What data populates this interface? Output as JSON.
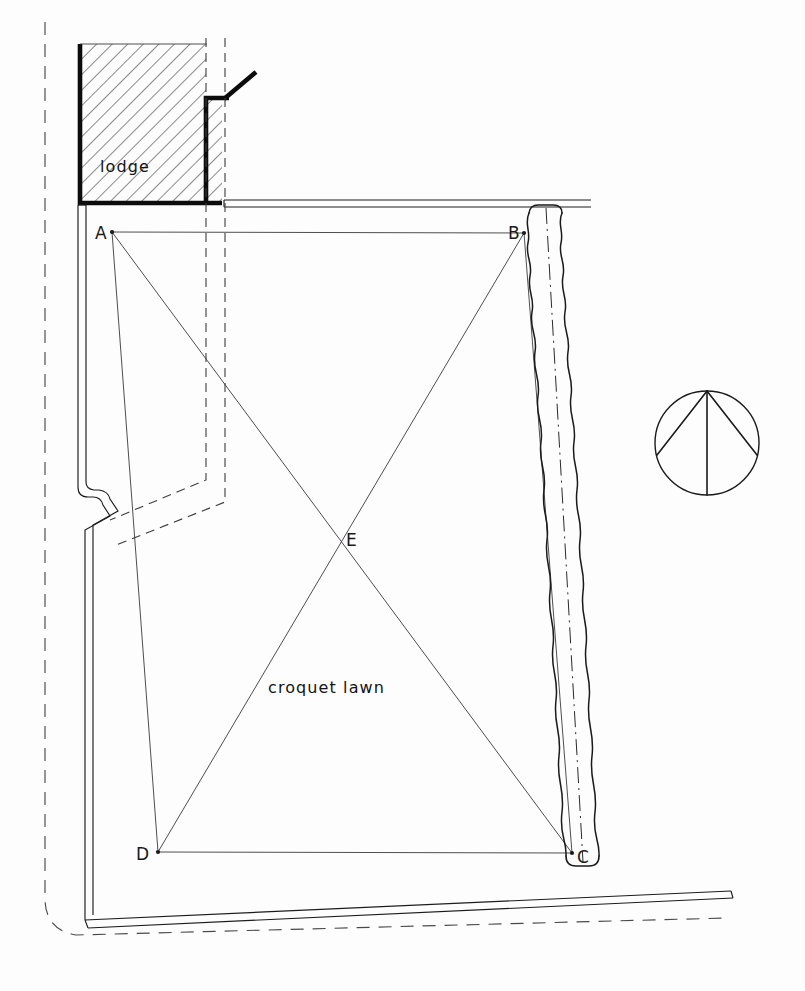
{
  "drawing": {
    "title": "Croquet lawn site plan",
    "type": "architectural-site-plan",
    "background_color": "#fdfdfd",
    "ink_color": "#1a1a1a"
  },
  "labels": {
    "lodge": "lodge",
    "lawn": "croquet lawn",
    "point_a": "A",
    "point_b": "B",
    "point_c": "C",
    "point_d": "D",
    "point_e": "E"
  },
  "geometry": {
    "lawn_quad": {
      "a": [
        112,
        232
      ],
      "b": [
        524,
        233
      ],
      "c": [
        572,
        853
      ],
      "d": [
        158,
        852
      ],
      "e": [
        337,
        538
      ]
    },
    "diagonals": [
      "A-C",
      "B-D"
    ],
    "label_offsets": {
      "a": [
        95,
        238
      ],
      "b": [
        509,
        238
      ],
      "c": [
        578,
        862
      ],
      "d": [
        138,
        860
      ],
      "e": [
        346,
        546
      ]
    }
  },
  "features": {
    "lodge_label": "lodge",
    "lodge_hatched": true,
    "hedge_label": "hedge",
    "hedge_centreline": "dash-dot",
    "boundary_line": "dashed",
    "compass_label": "north-point"
  },
  "compass": {
    "center": [
      707,
      443
    ],
    "radius": 52,
    "apex": [
      707,
      391
    ]
  }
}
